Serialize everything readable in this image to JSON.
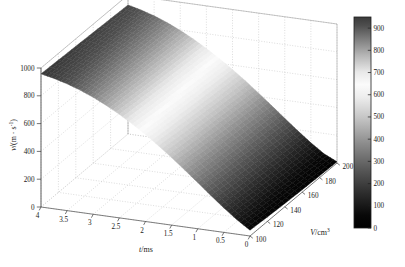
{
  "figure": {
    "width": 405,
    "height": 267,
    "background": "#ffffff"
  },
  "chart_data": {
    "type": "surface3d",
    "title": "",
    "xlabel": "t/ms",
    "ylabel": "V/cm3",
    "zlabel": "v/(m · s-1)",
    "xlabel_parts": {
      "italic": "t",
      "rest": "/ms"
    },
    "ylabel_parts": {
      "italic": "V",
      "rest": "/cm",
      "sup": "3"
    },
    "zlabel_parts": {
      "italic": "v",
      "rest": "/(m · s",
      "sup": "-1",
      "tail": ")"
    },
    "x": {
      "name": "t",
      "unit": "ms",
      "min": 0,
      "max": 4,
      "reversed": true,
      "ticks": [
        4,
        3.5,
        3,
        2.5,
        2,
        1.5,
        1,
        0.5,
        0
      ],
      "tick_labels": [
        "4",
        "3.5",
        "3",
        "2.5",
        "2",
        "1.5",
        "1",
        "0.5",
        "0"
      ]
    },
    "y": {
      "name": "V",
      "unit": "cm3",
      "min": 100,
      "max": 200,
      "reversed": false,
      "ticks": [
        100,
        120,
        140,
        160,
        180,
        200
      ],
      "tick_labels": [
        "100",
        "120",
        "140",
        "160",
        "180",
        "200"
      ],
      "last_label_clipped": true
    },
    "z": {
      "name": "v",
      "unit": "m/s",
      "min": 0,
      "max": 1000,
      "ticks": [
        0,
        200,
        400,
        600,
        800,
        1000
      ],
      "tick_labels": [
        "0",
        "200",
        "400",
        "600",
        "800",
        "1000"
      ]
    },
    "colorbar": {
      "min": 0,
      "max": 950,
      "ticks": [
        0,
        100,
        200,
        300,
        400,
        500,
        600,
        700,
        800,
        900
      ],
      "tick_labels": [
        "0",
        "100",
        "200",
        "300",
        "400",
        "500",
        "600",
        "700",
        "800",
        "900"
      ],
      "colormap": "inverted-gray-band",
      "stops": [
        {
          "pos": 0.0,
          "color": "#000000"
        },
        {
          "pos": 0.06,
          "color": "#080808"
        },
        {
          "pos": 0.16,
          "color": "#2b2b2b"
        },
        {
          "pos": 0.28,
          "color": "#595959"
        },
        {
          "pos": 0.4,
          "color": "#8c8c8c"
        },
        {
          "pos": 0.52,
          "color": "#c4c4c4"
        },
        {
          "pos": 0.62,
          "color": "#ededed"
        },
        {
          "pos": 0.68,
          "color": "#fbfbfb"
        },
        {
          "pos": 0.74,
          "color": "#e8e8e8"
        },
        {
          "pos": 0.82,
          "color": "#b4b4b4"
        },
        {
          "pos": 0.9,
          "color": "#7a7a7a"
        },
        {
          "pos": 0.96,
          "color": "#4e4e4e"
        },
        {
          "pos": 1.0,
          "color": "#3a3a3a"
        }
      ]
    },
    "surface": {
      "description": "Ribbon-like velocity surface v(t,V) descending from ~1000 m/s at t=4 ms toward 0 m/s near t=0 ms, shaded by v value",
      "t_samples": [
        4.0,
        3.75,
        3.5,
        3.25,
        3.0,
        2.75,
        2.5,
        2.25,
        2.0,
        1.75,
        1.5,
        1.25,
        1.0,
        0.75,
        0.5,
        0.25,
        0.0
      ],
      "V_samples": [
        100,
        120,
        140,
        160,
        180,
        200
      ],
      "v_values": [
        [
          958,
          952,
          946,
          940,
          934,
          928
        ],
        [
          938,
          931,
          924,
          918,
          911,
          905
        ],
        [
          912,
          904,
          897,
          890,
          883,
          876
        ],
        [
          880,
          871,
          863,
          855,
          848,
          840
        ],
        [
          841,
          831,
          822,
          813,
          805,
          797
        ],
        [
          796,
          785,
          775,
          766,
          757,
          748
        ],
        [
          745,
          733,
          722,
          712,
          702,
          693
        ],
        [
          688,
          675,
          664,
          653,
          643,
          633
        ],
        [
          626,
          612,
          600,
          589,
          578,
          568
        ],
        [
          558,
          544,
          531,
          519,
          508,
          498
        ],
        [
          486,
          471,
          458,
          446,
          435,
          424
        ],
        [
          410,
          395,
          382,
          369,
          358,
          347
        ],
        [
          332,
          317,
          303,
          291,
          280,
          269
        ],
        [
          253,
          238,
          225,
          213,
          202,
          192
        ],
        [
          176,
          161,
          149,
          138,
          128,
          119
        ],
        [
          104,
          91,
          80,
          70,
          62,
          54
        ],
        [
          42,
          32,
          24,
          18,
          13,
          9
        ]
      ]
    },
    "view": {
      "azimuth_deg": -37.5,
      "elevation_deg": 30,
      "grid": true,
      "box": false,
      "legend": "none",
      "colorbar_position": "right"
    }
  }
}
